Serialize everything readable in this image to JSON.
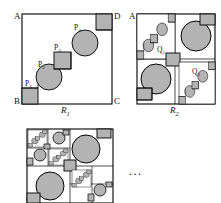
{
  "figure": {
    "caption_1": "R",
    "caption_1_sub": "1",
    "caption_2": "R",
    "caption_2_sub": "2",
    "ellipsis": "...",
    "colors": {
      "fill_gray": "#b3b3b3",
      "stroke": "#000000",
      "background": "#ffffff",
      "hatch": "#8c8c8c"
    }
  },
  "panels": [
    {
      "id": "R1",
      "name": "square-R1",
      "caption": "R1",
      "corner_labels": [
        {
          "text": "A",
          "corner": "top-left"
        },
        {
          "text": "D",
          "corner": "top-right"
        },
        {
          "text": "B",
          "corner": "bottom-left"
        },
        {
          "text": "C",
          "corner": "bottom-right"
        }
      ],
      "part_labels": [
        {
          "text": "P",
          "sub": "1",
          "target": "square-lower-left"
        },
        {
          "text": "P",
          "sub": "2",
          "target": "circle-lower"
        },
        {
          "text": "P",
          "sub": "3",
          "target": "square-middle"
        },
        {
          "text": "P",
          "sub": "4",
          "target": "circle-upper"
        }
      ],
      "description": "Unit square ABCD with a staircase of alternating gray squares and gray disks running from corner B to corner D"
    },
    {
      "id": "R2",
      "name": "square-R2",
      "caption": "R2",
      "corner_labels": [
        {
          "text": "A",
          "corner": "top-left"
        }
      ],
      "part_labels": [
        {
          "text": "Q",
          "sub": "1",
          "target": "subsquare-top-left"
        },
        {
          "text": "Q",
          "sub": "2",
          "target": "subsquare-bottom-right"
        }
      ],
      "description": "Second iteration: two opposite sub-squares contain scaled copies of the R1 staircase"
    },
    {
      "id": "R3",
      "name": "square-R3",
      "caption": "",
      "corner_labels": [],
      "part_labels": [],
      "description": "Third iteration: sub-squares of the sub-squares carry hatched copies of the staircase"
    }
  ]
}
